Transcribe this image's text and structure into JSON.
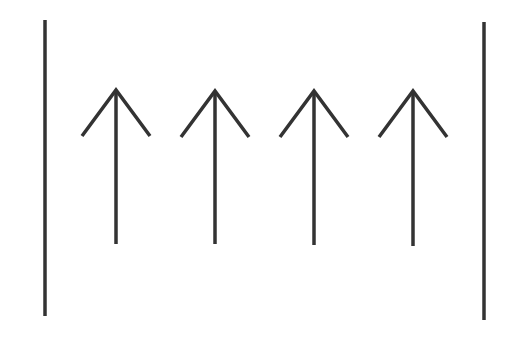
{
  "diagram": {
    "background": "#ffffff",
    "stroke_color": "#333333",
    "stroke_width": 3.5,
    "boundaries": [
      {
        "name": "left-boundary-line",
        "x": 45,
        "y1": 20,
        "y2": 316
      },
      {
        "name": "right-boundary-line",
        "x": 484,
        "y1": 22,
        "y2": 320
      }
    ],
    "arrows": [
      {
        "x": 116,
        "tip_y": 90,
        "tail_y": 244,
        "head_dx": 34,
        "head_dy": 46,
        "direction": "up"
      },
      {
        "x": 215,
        "tip_y": 91,
        "tail_y": 244,
        "head_dx": 34,
        "head_dy": 46,
        "direction": "up"
      },
      {
        "x": 314,
        "tip_y": 91,
        "tail_y": 245,
        "head_dx": 34,
        "head_dy": 46,
        "direction": "up"
      },
      {
        "x": 413,
        "tip_y": 91,
        "tail_y": 246,
        "head_dx": 34,
        "head_dy": 46,
        "direction": "up"
      }
    ]
  }
}
